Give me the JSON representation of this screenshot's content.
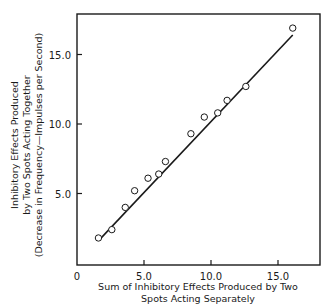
{
  "chart_data": {
    "type": "scatter",
    "title": "",
    "xlabel": [
      "Sum of Inhibitory Effects Produced by Two",
      "Spots Acting Separately"
    ],
    "ylabel": [
      "Inhibitory Effects Produced",
      "by Two Spots Acting Together",
      "(Decrease in Frequency—Impulses per Second)"
    ],
    "xlim": [
      0,
      18
    ],
    "ylim": [
      0,
      18
    ],
    "x_ticks": [
      0,
      5.0,
      10.0,
      15.0
    ],
    "x_tick_labels": [
      "0",
      "5.0",
      "10.0",
      "15.0"
    ],
    "y_ticks": [
      5.0,
      10.0,
      15.0
    ],
    "y_tick_labels": [
      "5.0",
      "10.0",
      "15.0"
    ],
    "grid": false,
    "legend": null,
    "series": [
      {
        "name": "observations",
        "marker": "open-circle",
        "x": [
          1.6,
          2.6,
          3.6,
          4.3,
          5.3,
          6.1,
          6.6,
          8.5,
          9.5,
          10.5,
          11.2,
          12.6,
          16.1
        ],
        "y": [
          1.8,
          2.4,
          4.0,
          5.2,
          6.1,
          6.4,
          7.3,
          9.3,
          10.5,
          10.8,
          11.7,
          12.7,
          16.9
        ]
      },
      {
        "name": "fit-line",
        "type": "line",
        "x": [
          1.7,
          16.1
        ],
        "y": [
          1.7,
          16.4
        ]
      }
    ]
  }
}
